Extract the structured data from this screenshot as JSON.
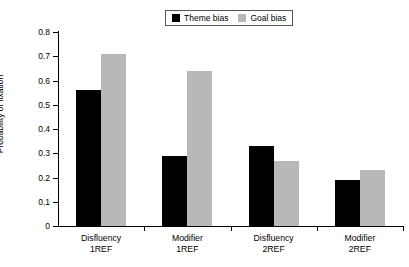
{
  "chart_data": {
    "type": "bar",
    "title": "",
    "xlabel": "",
    "ylabel": "Probability of fixation",
    "ylim": [
      0,
      0.8
    ],
    "ytick_values": [
      0.8,
      0.7,
      0.6,
      0.5,
      0.4,
      0.3,
      0.2,
      0.1,
      0
    ],
    "ytick_labels": [
      "0.8",
      "0.7",
      "0.6",
      "0.5",
      "0.4",
      "0.3",
      "0.2",
      "0.1",
      "0"
    ],
    "grid": false,
    "legend_position": "top-center",
    "categories": [
      "Disfluency 1REF",
      "Modifier 1REF",
      "Disfluency 2REF",
      "Modifier 2REF"
    ],
    "category_lines": [
      [
        "Disfluency",
        "1REF"
      ],
      [
        "Modifier",
        "1REF"
      ],
      [
        "Disfluency",
        "2REF"
      ],
      [
        "Modifier",
        "2REF"
      ]
    ],
    "series": [
      {
        "name": "Theme bias",
        "color": "#000000",
        "values": [
          0.56,
          0.29,
          0.33,
          0.19
        ]
      },
      {
        "name": "Goal bias",
        "color": "#b8b8b8",
        "values": [
          0.71,
          0.64,
          0.27,
          0.23
        ]
      }
    ]
  }
}
